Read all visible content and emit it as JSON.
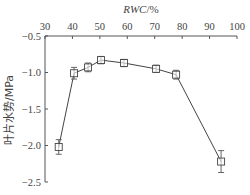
{
  "chart_data": {
    "type": "line",
    "title": "",
    "xlabel": "RWC/%",
    "xlabel_italic_part": "RWC",
    "xlabel_suffix": "/%",
    "ylabel": "叶片水势/MPa",
    "x_axis_position": "top",
    "xlim": [
      30,
      100
    ],
    "ylim": [
      -2.5,
      -0.5
    ],
    "xticks": [
      30,
      40,
      50,
      60,
      70,
      80,
      90,
      100
    ],
    "xtick_labels": [
      "30",
      "40",
      "50",
      "60",
      "70",
      "80",
      "90",
      "100"
    ],
    "yticks": [
      -0.5,
      -1.0,
      -1.5,
      -2.0,
      -2.5
    ],
    "ytick_labels": [
      "-0.5",
      "-1.0",
      "-1.5",
      "-2.0",
      "-2.5"
    ],
    "grid": false,
    "legend": null,
    "marker": "open-square",
    "series": [
      {
        "name": "叶片水势",
        "x": [
          35.0,
          40.6,
          45.7,
          50.4,
          58.8,
          70.5,
          77.8,
          94.2
        ],
        "y": [
          -2.02,
          -1.01,
          -0.93,
          -0.83,
          -0.87,
          -0.95,
          -1.03,
          -2.22
        ],
        "error": [
          0.1,
          0.08,
          0.06,
          0.05,
          0.05,
          0.05,
          0.06,
          0.15
        ]
      }
    ]
  }
}
